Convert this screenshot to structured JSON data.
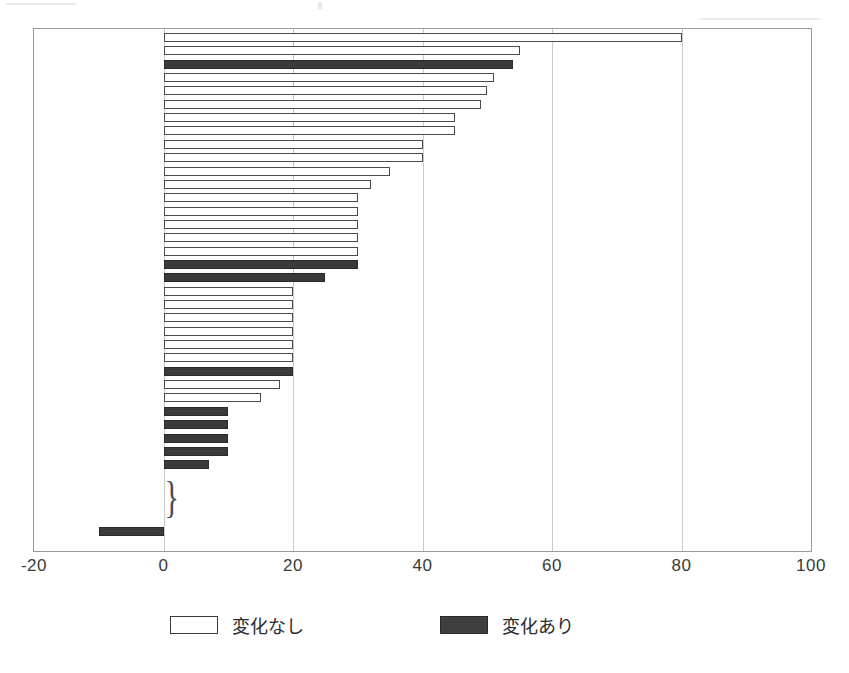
{
  "chart_data": {
    "type": "bar",
    "orientation": "horizontal",
    "title": "",
    "subtitle": "",
    "xlabel": "",
    "ylabel": "",
    "xlim": [
      -20,
      100
    ],
    "xticks": [
      -20,
      0,
      20,
      40,
      60,
      80,
      100
    ],
    "xtick_labels": [
      "-20",
      "0",
      "20",
      "40",
      "60",
      "80",
      "100"
    ],
    "grid": "vertical",
    "legend_position": "bottom",
    "legend": [
      {
        "key": "nochange",
        "label": "変化なし",
        "color": "#ffffff",
        "edge": "#4a4a4a"
      },
      {
        "key": "changed",
        "label": "変化あり",
        "color": "#3a3a3a",
        "edge": "#2a2a2a"
      }
    ],
    "annotations": [
      {
        "name": "zero-group-brace",
        "symbol": "}",
        "note": "brace grouping bars of value 0"
      }
    ],
    "categories": [
      "bar-01",
      "bar-02",
      "bar-03",
      "bar-04",
      "bar-05",
      "bar-06",
      "bar-07",
      "bar-08",
      "bar-09",
      "bar-10",
      "bar-11",
      "bar-12",
      "bar-13",
      "bar-14",
      "bar-15",
      "bar-16",
      "bar-17",
      "bar-18",
      "bar-19",
      "bar-20",
      "bar-21",
      "bar-22",
      "bar-23",
      "bar-24",
      "bar-25",
      "bar-26",
      "bar-27",
      "bar-28",
      "bar-29",
      "bar-30",
      "bar-31",
      "bar-32",
      "bar-33",
      "bar-34",
      "bar-35",
      "bar-36",
      "bar-37",
      "bar-38"
    ],
    "values": [
      80,
      55,
      54,
      51,
      50,
      49,
      45,
      45,
      40,
      40,
      35,
      32,
      30,
      30,
      30,
      30,
      30,
      30,
      25,
      20,
      20,
      20,
      20,
      20,
      20,
      20,
      18,
      15,
      10,
      10,
      10,
      10,
      7,
      0,
      0,
      0,
      0,
      -10
    ],
    "series_keys": [
      "nochange",
      "nochange",
      "changed",
      "nochange",
      "nochange",
      "nochange",
      "nochange",
      "nochange",
      "nochange",
      "nochange",
      "nochange",
      "nochange",
      "nochange",
      "nochange",
      "nochange",
      "nochange",
      "nochange",
      "changed",
      "changed",
      "nochange",
      "nochange",
      "nochange",
      "nochange",
      "nochange",
      "nochange",
      "changed",
      "nochange",
      "nochange",
      "changed",
      "changed",
      "changed",
      "changed",
      "changed",
      "nochange",
      "nochange",
      "nochange",
      "nochange",
      "changed"
    ]
  },
  "axis": {
    "ticks": [
      {
        "value": -20,
        "label": "-20"
      },
      {
        "value": 0,
        "label": "0"
      },
      {
        "value": 20,
        "label": "20"
      },
      {
        "value": 40,
        "label": "40"
      },
      {
        "value": 60,
        "label": "60"
      },
      {
        "value": 80,
        "label": "80"
      },
      {
        "value": 100,
        "label": "100"
      }
    ]
  },
  "legend": {
    "nochange_label": "変化なし",
    "changed_label": "変化あり"
  },
  "colors": {
    "bar_nochange_fill": "#ffffff",
    "bar_nochange_edge": "#4a4a4a",
    "bar_changed_fill": "#3a3a3a",
    "bar_changed_edge": "#2a2a2a",
    "gridline": "#c9c9c9",
    "frame": "#9a9a9a",
    "background": "#ffffff"
  },
  "brace": {
    "symbol": "}"
  }
}
